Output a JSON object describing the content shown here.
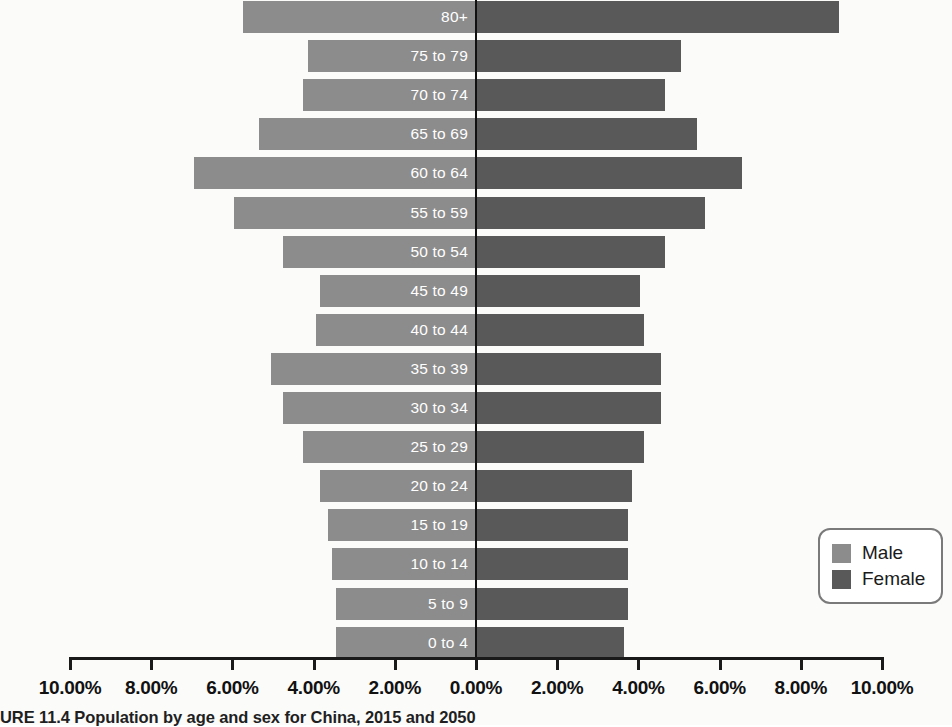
{
  "chart_data": {
    "type": "bar",
    "subtype": "population-pyramid",
    "title": "",
    "xlabel": "",
    "ylabel": "",
    "orientation": "horizontal-diverging",
    "grid": false,
    "xlim": [
      -10,
      10
    ],
    "xtick_values": [
      -10,
      -8,
      -6,
      -4,
      -2,
      0,
      2,
      4,
      6,
      8,
      10
    ],
    "xtick_labels": [
      "10.00%",
      "8.00%",
      "6.00%",
      "4.00%",
      "2.00%",
      "0.00%",
      "2.00%",
      "4.00%",
      "6.00%",
      "8.00%",
      "10.00%"
    ],
    "categories": [
      "80+",
      "75 to 79",
      "70 to 74",
      "65 to 69",
      "60 to 64",
      "55 to 59",
      "50 to 54",
      "45 to 49",
      "40 to 44",
      "35 to 39",
      "30 to 34",
      "25 to 29",
      "20 to 24",
      "15 to 19",
      "10 to 14",
      "5 to 9",
      "0 to 4"
    ],
    "series": [
      {
        "name": "Male",
        "color": "#8c8c8c",
        "side": "left",
        "values": [
          5.75,
          4.15,
          4.25,
          5.35,
          6.95,
          5.95,
          4.75,
          3.85,
          3.95,
          5.05,
          4.75,
          4.25,
          3.85,
          3.65,
          3.55,
          3.45,
          3.45
        ]
      },
      {
        "name": "Female",
        "color": "#595959",
        "side": "right",
        "values": [
          8.95,
          5.05,
          4.65,
          5.45,
          6.55,
          5.65,
          4.65,
          4.05,
          4.15,
          4.55,
          4.55,
          4.15,
          3.85,
          3.75,
          3.75,
          3.75,
          3.65
        ]
      }
    ],
    "legend": {
      "position": "bottom-right",
      "entries": [
        {
          "label": "Male",
          "color": "#8c8c8c"
        },
        {
          "label": "Female",
          "color": "#595959"
        }
      ]
    }
  },
  "legend": {
    "male_label": "Male",
    "female_label": "Female"
  },
  "caption": {
    "text": "URE 11.4 Population by age and sex for China, 2015 and 2050"
  },
  "colors": {
    "male": "#8c8c8c",
    "female": "#595959",
    "axis": "#1a1a1a",
    "label_text": "#ffffff",
    "background": "#fbfbfa"
  }
}
